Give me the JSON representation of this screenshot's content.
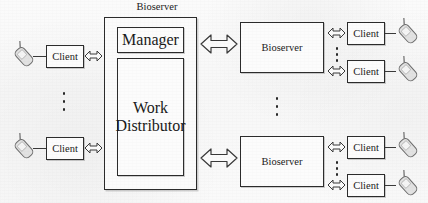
{
  "diagram": {
    "title_label": "Bioserver",
    "center_server": {
      "label": "Bioserver",
      "manager_label": "Manager",
      "work_distributor_label": "Work Distributor",
      "work_distributor_line1": "Work",
      "work_distributor_line2": "Distributor"
    },
    "left_clients": [
      {
        "label": "Client",
        "device": "mobile-phone-icon"
      },
      {
        "label": "Client",
        "device": "mobile-phone-icon"
      }
    ],
    "left_ellipsis": "vertical-ellipsis",
    "center_ellipsis": "vertical-ellipsis",
    "remote_servers": [
      {
        "label": "Bioserver",
        "clients": [
          {
            "label": "Client",
            "device": "mobile-phone-icon"
          },
          {
            "label": "Client",
            "device": "mobile-phone-icon"
          }
        ],
        "client_ellipsis": "vertical-ellipsis"
      },
      {
        "label": "Bioserver",
        "clients": [
          {
            "label": "Client",
            "device": "mobile-phone-icon"
          },
          {
            "label": "Client",
            "device": "mobile-phone-icon"
          }
        ],
        "client_ellipsis": "vertical-ellipsis"
      }
    ],
    "connectors": {
      "client_link": "double-headed-arrow-icon",
      "server_link": "double-headed-arrow-icon"
    },
    "colors": {
      "stroke": "#2c2c2c",
      "fill": "#fcfcfc",
      "text": "#1a1a1a",
      "background": "#fafafa"
    }
  }
}
